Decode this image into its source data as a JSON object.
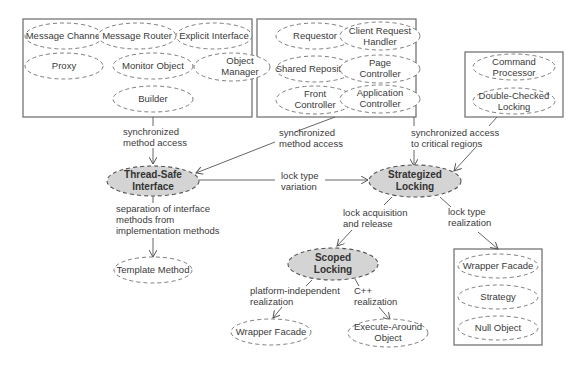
{
  "groups": {
    "left": {
      "patterns": [
        "Message Channel",
        "Message Router",
        "Explicit Interface",
        "Proxy",
        "Monitor Object",
        "Object Manager",
        "Builder"
      ]
    },
    "middle": {
      "patterns": [
        "Requestor",
        "Client Request Handler",
        "Shared Repository",
        "Page Controller",
        "Front Controller",
        "Application Controller"
      ]
    },
    "right": {
      "patterns": [
        "Command Processor",
        "Double-Checked Locking"
      ]
    },
    "bottom_right": {
      "patterns": [
        "Wrapper Facade",
        "Strategy",
        "Null Object"
      ]
    }
  },
  "main_patterns": {
    "thread_safe_interface": "Thread-Safe Interface",
    "strategized_locking": "Strategized Locking",
    "scoped_locking": "Scoped Locking"
  },
  "leaf_patterns": {
    "template_method": "Template Method",
    "wrapper_facade": "Wrapper Facade",
    "execute_around_object": "Execute-Around Object"
  },
  "edges": {
    "left_to_tsi": "synchronized method access",
    "middle_to_tsi": "synchronized method access",
    "to_strategized": "synchronized access to critical regions",
    "tsi_to_strategized": "lock type variation",
    "tsi_to_template": "separation of interface methods from implementation methods",
    "strategized_to_scoped": "lock acquisition and release",
    "strategized_to_realization": "lock type realization",
    "scoped_to_wrapper": "platform-independent realization",
    "scoped_to_execute": "C++ realization"
  }
}
